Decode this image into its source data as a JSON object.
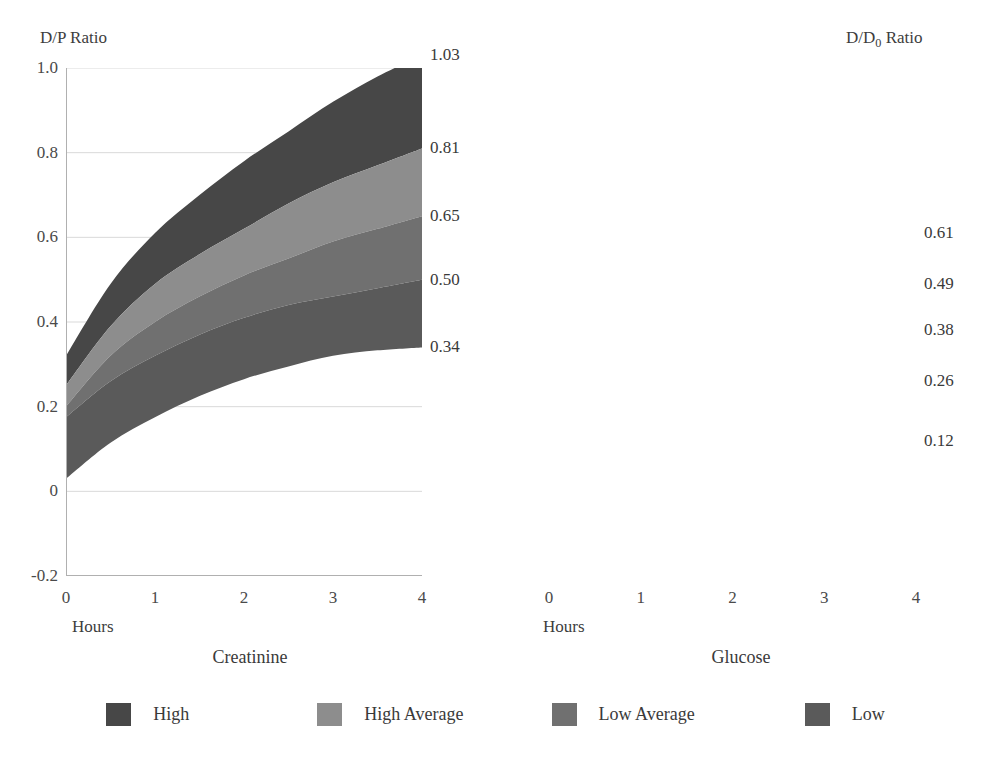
{
  "chart_data": [
    {
      "type": "area",
      "title": "Creatinine",
      "ylabel": "D/P Ratio",
      "xlabel": "Hours",
      "ylim": [
        -0.2,
        1.0
      ],
      "xlim": [
        0,
        4
      ],
      "grid": true,
      "ytick_labels": [
        "1.0",
        "0.8",
        "0.6",
        "0.4",
        "0.2",
        "0",
        "-0.2"
      ],
      "ytick_values": [
        1.0,
        0.8,
        0.6,
        0.4,
        0.2,
        0,
        -0.2
      ],
      "xtick_labels": [
        "0",
        "1",
        "2",
        "3",
        "4"
      ],
      "xtick_values": [
        0,
        1,
        2,
        3,
        4
      ],
      "right_axis_labels": [
        "1.03",
        "0.81",
        "0.65",
        "0.50",
        "0.34"
      ],
      "right_axis_values": [
        1.03,
        0.81,
        0.65,
        0.5,
        0.34
      ],
      "x": [
        0,
        0.5,
        1,
        1.5,
        2,
        2.5,
        3,
        3.5,
        4
      ],
      "boundaries": [
        {
          "name": "High top",
          "values": [
            0.32,
            0.49,
            0.61,
            0.7,
            0.78,
            0.85,
            0.92,
            0.98,
            1.03
          ]
        },
        {
          "name": "High Average top",
          "values": [
            0.25,
            0.39,
            0.49,
            0.56,
            0.62,
            0.68,
            0.73,
            0.77,
            0.81
          ]
        },
        {
          "name": "Low Average top",
          "values": [
            0.2,
            0.32,
            0.4,
            0.46,
            0.51,
            0.55,
            0.59,
            0.62,
            0.65
          ]
        },
        {
          "name": "Low top",
          "values": [
            0.175,
            0.26,
            0.32,
            0.37,
            0.41,
            0.44,
            0.46,
            0.48,
            0.5
          ]
        },
        {
          "name": "Low bottom",
          "values": [
            0.03,
            0.115,
            0.175,
            0.225,
            0.265,
            0.295,
            0.32,
            0.333,
            0.34
          ]
        }
      ],
      "series": [
        {
          "name": "High",
          "color": "#474747"
        },
        {
          "name": "High Average",
          "color": "#8d8d8d"
        },
        {
          "name": "Low Average",
          "color": "#707070"
        },
        {
          "name": "Low",
          "color": "#5a5a5a"
        }
      ]
    },
    {
      "type": "area",
      "title": "Glucose",
      "ylabel": "D/D₀ Ratio",
      "xlabel": "Hours",
      "ylim": [
        -0.2,
        1.0
      ],
      "xlim": [
        0,
        4
      ],
      "grid": true,
      "xtick_labels": [
        "0",
        "1",
        "2",
        "3",
        "4"
      ],
      "xtick_values": [
        0,
        1,
        2,
        3,
        4
      ],
      "right_axis_labels": [
        "0.61",
        "0.49",
        "0.38",
        "0.26",
        "0.12"
      ],
      "right_axis_values": [
        0.61,
        0.49,
        0.38,
        0.26,
        0.12
      ],
      "x": [
        0,
        0.5,
        1,
        1.5,
        2,
        2.5,
        3,
        3.5,
        4
      ],
      "boundaries": [
        {
          "name": "High top",
          "values": [
            0.81,
            0.785,
            0.757,
            0.727,
            0.697,
            0.667,
            0.64,
            0.622,
            0.61
          ]
        },
        {
          "name": "High Average top",
          "values": [
            0.81,
            0.755,
            0.705,
            0.655,
            0.605,
            0.558,
            0.52,
            0.5,
            0.49
          ]
        },
        {
          "name": "Low Average top",
          "values": [
            0.81,
            0.735,
            0.665,
            0.6,
            0.54,
            0.485,
            0.435,
            0.4,
            0.38
          ]
        },
        {
          "name": "Low top",
          "values": [
            0.81,
            0.715,
            0.625,
            0.545,
            0.47,
            0.4,
            0.33,
            0.285,
            0.26
          ]
        },
        {
          "name": "Low bottom",
          "values": [
            0.81,
            0.6,
            0.44,
            0.315,
            0.215,
            0.148,
            0.108,
            0.098,
            0.12
          ]
        }
      ],
      "series": [
        {
          "name": "High",
          "color": "#474747"
        },
        {
          "name": "High Average",
          "color": "#8d8d8d"
        },
        {
          "name": "Low Average",
          "color": "#707070"
        },
        {
          "name": "Low",
          "color": "#5a5a5a"
        }
      ]
    }
  ],
  "left": {
    "yaxis_title": "D/P Ratio",
    "xaxis_label": "Hours",
    "panel_title": "Creatinine"
  },
  "right": {
    "yaxis_title_prefix": "D/D",
    "yaxis_title_sub": "0",
    "yaxis_title_suffix": " Ratio",
    "xaxis_label": "Hours",
    "panel_title": "Glucose"
  },
  "legend": {
    "items": [
      {
        "label": "High",
        "color": "#474747"
      },
      {
        "label": "High Average",
        "color": "#8d8d8d"
      },
      {
        "label": "Low Average",
        "color": "#707070"
      },
      {
        "label": "Low",
        "color": "#5a5a5a"
      }
    ]
  },
  "colors": {
    "grid": "#d9d9d9",
    "axis": "#b0b0b0",
    "text": "#3a3a3a",
    "background": "#ffffff"
  }
}
